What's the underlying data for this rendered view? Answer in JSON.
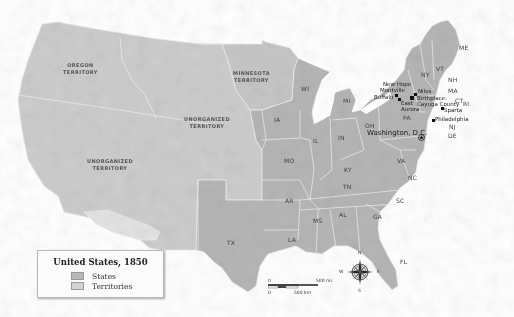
{
  "legend": {
    "title": "United States, 1850",
    "items": [
      {
        "label": "States",
        "color": "#b8b8b8"
      },
      {
        "label": "Territories",
        "color": "#d4d4d4"
      }
    ]
  },
  "territories": {
    "oregon": [
      "Oregon",
      "Territory"
    ],
    "minnesota": [
      "Minnesota",
      "Territory"
    ],
    "unorganized_central": [
      "Unorganized",
      "Territory"
    ],
    "unorganized_west": [
      "Unorganized",
      "Territory"
    ]
  },
  "states": {
    "ME": "ME",
    "VT": "VT",
    "NH": "NH",
    "NY": "NY",
    "MA": "MA",
    "CT": "CT",
    "RI": "RI",
    "NJ": "NJ",
    "DE": "DE",
    "MD": "MD",
    "PA": "PA",
    "OH": "OH",
    "MI": "MI",
    "WI": "WI",
    "IA": "IA",
    "IL": "IL",
    "IN": "IN",
    "MO": "MO",
    "KY": "KY",
    "VA": "VA",
    "NC": "NC",
    "TN": "TN",
    "SC": "SC",
    "AR": "AR",
    "MS": "MS",
    "AL": "AL",
    "GA": "GA",
    "LA": "LA",
    "TX": "TX",
    "FL": "FL"
  },
  "cities": {
    "new_hope": "New Hope",
    "montville": "Montville",
    "buffalo": "Buffalo",
    "east_aurora": [
      "East",
      "Aurora"
    ],
    "niles": "Niles",
    "birthplace": "Birthplace:",
    "cayuga": "Cayuga County",
    "sparta": "Sparta",
    "philadelphia": "Philadelphia",
    "washington": "Washington, D.C."
  },
  "scale": {
    "mi_start": "0",
    "mi_end": "500 mi.",
    "km_start": "0",
    "km_end": "500 km"
  },
  "compass": {
    "n": "N",
    "s": "S",
    "e": "E",
    "w": "W"
  },
  "colors": {
    "state_fill": "#b9b9b9",
    "territory_fill": "#cfcfcf",
    "mexican_cession_light": "#e6e6e6",
    "border": "#eeeeee",
    "water": "#ffffff"
  }
}
